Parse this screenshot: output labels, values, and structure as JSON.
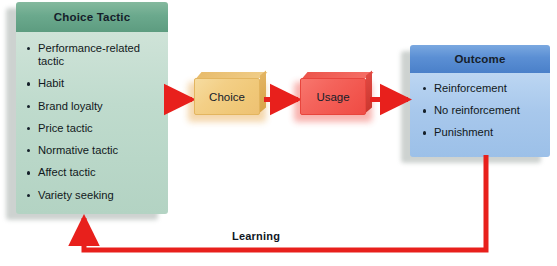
{
  "diagram": {
    "colors": {
      "arrow_red": "#E8201C",
      "green_header": "#6BA98D",
      "green_body": "#BFDBCD",
      "blue_header": "#5B8FD4",
      "blue_body": "#A8C8EC",
      "orange_box": "#F3CF86",
      "red_box": "#F4645C",
      "text": "#15202A",
      "background": "#FFFFFF"
    }
  },
  "choice_tactic_panel": {
    "title": "Choice Tactic",
    "items": [
      "Performance-related tactic",
      "Habit",
      "Brand loyalty",
      "Price tactic",
      "Normative tactic",
      "Affect tactic",
      "Variety seeking"
    ]
  },
  "choice_box": {
    "label": "Choice"
  },
  "usage_box": {
    "label": "Usage"
  },
  "outcome_panel": {
    "title": "Outcome",
    "items": [
      "Reinforcement",
      "No reinforcement",
      "Punishment"
    ]
  },
  "feedback": {
    "label": "Learning"
  },
  "flow": {
    "steps": [
      "Choice Tactic",
      "Choice",
      "Usage",
      "Outcome"
    ],
    "feedback_from": "Outcome",
    "feedback_to": "Choice Tactic"
  }
}
